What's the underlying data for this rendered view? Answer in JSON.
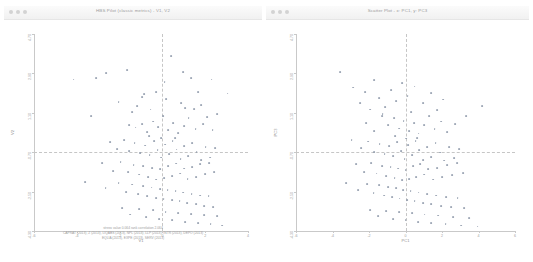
{
  "window_left": {
    "title": "HBS Pilot (classic metrics) - V1, V2",
    "controls": [
      "close-dot",
      "minimize-dot",
      "zoom-dot"
    ]
  },
  "window_right": {
    "title": "Scatter Plot - x: PC1, y: PC3",
    "controls": [
      "close-dot",
      "minimize-dot",
      "zoom-dot"
    ]
  },
  "footer": {
    "line1": "stress value  0.064   rank correlation  2.064",
    "line2": "CAPRAT (2013), Z (2013), LIQABS (2013), NPL (2013), LLP (2013), INTR (2013), DEPO (2013)",
    "line3": "EQLIA (2013), EXPE (2013), SERV (2013)"
  },
  "chart_data": [
    {
      "type": "scatter",
      "title": "HBS Pilot (classic metrics) - V1, V2",
      "xlabel": "V1",
      "ylabel": "V2",
      "xlim": [
        -6,
        4
      ],
      "ylim": [
        -4.3,
        4.7
      ],
      "xticks": [
        -6,
        -4,
        -2,
        0,
        2,
        4
      ],
      "xticklabels": [
        "-6",
        "-4",
        "-2",
        "0",
        "2",
        "4"
      ],
      "yticks": [
        -4.3,
        -2.5,
        -0.7,
        1.1,
        2.9,
        4.7
      ],
      "yticklabels": [
        "-4.30",
        "-2.50",
        "-0.70",
        "1.10",
        "2.90",
        "4.70"
      ],
      "grid": false,
      "legend": "none",
      "reference_lines": {
        "vertical_x": 0.0,
        "horizontal_y": -0.7
      },
      "annotation": "stress value  0.064   rank correlation  2.064",
      "marker_color": "#8c96a8",
      "points": [
        [
          -4.15,
          2.62
        ],
        [
          -3.1,
          2.7
        ],
        [
          -2.62,
          2.9
        ],
        [
          -1.65,
          3.05
        ],
        [
          -2.05,
          1.6
        ],
        [
          -3.35,
          0.95
        ],
        [
          -1.2,
          1.42
        ],
        [
          -0.85,
          1.95
        ],
        [
          -0.95,
          1.8
        ],
        [
          -0.55,
          1.25
        ],
        [
          -0.3,
          2.05
        ],
        [
          0.1,
          2.52
        ],
        [
          0.42,
          3.7
        ],
        [
          0.95,
          2.95
        ],
        [
          1.35,
          2.7
        ],
        [
          2.3,
          2.62
        ],
        [
          0.88,
          1.55
        ],
        [
          1.05,
          1.3
        ],
        [
          1.48,
          1.28
        ],
        [
          1.8,
          1.45
        ],
        [
          -1.55,
          0.55
        ],
        [
          -1.25,
          0.42
        ],
        [
          -0.95,
          0.58
        ],
        [
          -0.7,
          0.22
        ],
        [
          -0.45,
          0.7
        ],
        [
          -0.2,
          0.45
        ],
        [
          0.05,
          0.95
        ],
        [
          0.25,
          0.3
        ],
        [
          0.5,
          0.62
        ],
        [
          0.75,
          0.18
        ],
        [
          1.0,
          0.5
        ],
        [
          1.22,
          0.85
        ],
        [
          1.55,
          0.35
        ],
        [
          1.9,
          0.6
        ],
        [
          2.1,
          0.9
        ],
        [
          2.35,
          0.3
        ],
        [
          -2.45,
          -0.25
        ],
        [
          -2.1,
          -0.55
        ],
        [
          -1.8,
          -0.15
        ],
        [
          -1.55,
          -0.65
        ],
        [
          -1.3,
          -0.3
        ],
        [
          -1.05,
          -0.75
        ],
        [
          -0.8,
          -0.4
        ],
        [
          -0.6,
          -0.85
        ],
        [
          -0.4,
          -0.2
        ],
        [
          -0.22,
          -0.62
        ],
        [
          -0.05,
          -0.95
        ],
        [
          0.12,
          -0.35
        ],
        [
          0.3,
          -0.78
        ],
        [
          0.48,
          -0.18
        ],
        [
          0.66,
          -0.58
        ],
        [
          0.85,
          -1.02
        ],
        [
          1.02,
          -0.42
        ],
        [
          1.2,
          -0.88
        ],
        [
          1.4,
          -0.28
        ],
        [
          1.6,
          -0.68
        ],
        [
          1.82,
          -1.05
        ],
        [
          2.02,
          -0.45
        ],
        [
          2.22,
          -0.95
        ],
        [
          2.45,
          -0.52
        ],
        [
          -2.8,
          -1.2
        ],
        [
          -2.3,
          -1.55
        ],
        [
          -1.95,
          -1.15
        ],
        [
          -1.6,
          -1.62
        ],
        [
          -1.35,
          -1.28
        ],
        [
          -1.1,
          -1.72
        ],
        [
          -0.9,
          -1.35
        ],
        [
          -0.68,
          -1.85
        ],
        [
          -0.48,
          -1.42
        ],
        [
          -0.28,
          -1.95
        ],
        [
          -0.1,
          -1.48
        ],
        [
          0.08,
          -1.88
        ],
        [
          0.28,
          -1.32
        ],
        [
          0.46,
          -1.78
        ],
        [
          0.64,
          -1.22
        ],
        [
          0.82,
          -1.68
        ],
        [
          1.0,
          -1.45
        ],
        [
          1.18,
          -1.92
        ],
        [
          1.38,
          -1.38
        ],
        [
          1.58,
          -1.82
        ],
        [
          1.78,
          -1.25
        ],
        [
          1.98,
          -1.7
        ],
        [
          2.18,
          -1.18
        ],
        [
          2.42,
          -1.6
        ],
        [
          -3.6,
          -2.05
        ],
        [
          -2.65,
          -2.35
        ],
        [
          -2.05,
          -2.1
        ],
        [
          -1.7,
          -2.52
        ],
        [
          -1.42,
          -2.18
        ],
        [
          -1.15,
          -2.62
        ],
        [
          -0.92,
          -2.25
        ],
        [
          -0.7,
          -2.7
        ],
        [
          -0.5,
          -2.32
        ],
        [
          -0.3,
          -2.78
        ],
        [
          -0.12,
          -2.38
        ],
        [
          0.06,
          -2.85
        ],
        [
          0.24,
          -2.42
        ],
        [
          0.44,
          -2.88
        ],
        [
          0.62,
          -2.48
        ],
        [
          0.8,
          -2.95
        ],
        [
          0.98,
          -2.55
        ],
        [
          1.16,
          -3.02
        ],
        [
          1.36,
          -2.6
        ],
        [
          1.56,
          -3.08
        ],
        [
          1.76,
          -2.68
        ],
        [
          1.96,
          -3.15
        ],
        [
          2.16,
          -2.72
        ],
        [
          2.38,
          -3.2
        ],
        [
          -1.9,
          -3.25
        ],
        [
          -1.5,
          -3.55
        ],
        [
          -1.1,
          -3.3
        ],
        [
          -0.75,
          -3.68
        ],
        [
          -0.45,
          -3.35
        ],
        [
          -0.15,
          -3.75
        ],
        [
          0.15,
          -3.42
        ],
        [
          0.45,
          -3.82
        ],
        [
          0.75,
          -3.48
        ],
        [
          1.05,
          -3.88
        ],
        [
          1.35,
          -3.52
        ],
        [
          1.65,
          -3.95
        ],
        [
          1.95,
          -3.58
        ],
        [
          2.25,
          -4.0
        ],
        [
          2.55,
          -3.62
        ],
        [
          2.8,
          -4.05
        ],
        [
          -0.62,
          0.05
        ],
        [
          0.18,
          1.72
        ],
        [
          1.68,
          2.05
        ],
        [
          2.55,
          1.05
        ],
        [
          -1.42,
          1.12
        ],
        [
          -0.05,
          -0.05
        ],
        [
          0.58,
          -0.05
        ],
        [
          3.05,
          1.98
        ]
      ]
    },
    {
      "type": "scatter",
      "title": "Scatter Plot - x: PC1, y: PC3",
      "xlabel": "PC1",
      "ylabel": "PC3",
      "xlim": [
        -6,
        6
      ],
      "ylim": [
        -4.3,
        4.7
      ],
      "xticks": [
        -6,
        -4,
        -2,
        0,
        2,
        4,
        6
      ],
      "xticklabels": [
        "-6",
        "-4",
        "-2",
        "0",
        "2",
        "4",
        "6"
      ],
      "yticks": [
        -4.3,
        -2.5,
        -0.7,
        1.1,
        2.9,
        4.7
      ],
      "yticklabels": [
        "-4.30",
        "-2.50",
        "-0.70",
        "1.10",
        "2.90",
        "4.70"
      ],
      "grid": false,
      "legend": "none",
      "reference_lines": {
        "vertical_x": 0.0,
        "horizontal_y": -0.7
      },
      "marker_color": "#8c96a8",
      "points": [
        [
          -3.6,
          2.95
        ],
        [
          -2.85,
          2.25
        ],
        [
          -2.2,
          2.05
        ],
        [
          -1.7,
          2.6
        ],
        [
          -2.5,
          1.55
        ],
        [
          -1.95,
          1.25
        ],
        [
          -1.45,
          1.78
        ],
        [
          -1.1,
          1.35
        ],
        [
          -0.8,
          2.15
        ],
        [
          -0.5,
          1.62
        ],
        [
          -0.2,
          2.45
        ],
        [
          0.12,
          1.85
        ],
        [
          0.5,
          2.3
        ],
        [
          0.95,
          1.55
        ],
        [
          1.4,
          2.0
        ],
        [
          2.05,
          1.7
        ],
        [
          -1.3,
          0.95
        ],
        [
          -0.95,
          0.52
        ],
        [
          -0.62,
          0.85
        ],
        [
          -0.35,
          0.38
        ],
        [
          -0.1,
          0.72
        ],
        [
          0.18,
          0.25
        ],
        [
          0.45,
          0.62
        ],
        [
          0.72,
          0.15
        ],
        [
          1.0,
          0.55
        ],
        [
          1.28,
          0.95
        ],
        [
          1.6,
          0.35
        ],
        [
          1.95,
          0.7
        ],
        [
          2.3,
          0.22
        ],
        [
          2.7,
          0.58
        ],
        [
          -1.7,
          0.28
        ],
        [
          -2.15,
          0.62
        ],
        [
          -2.95,
          -0.15
        ],
        [
          -2.45,
          -0.52
        ],
        [
          -2.05,
          -0.22
        ],
        [
          -1.72,
          -0.68
        ],
        [
          -1.42,
          -0.32
        ],
        [
          -1.15,
          -0.78
        ],
        [
          -0.9,
          -0.42
        ],
        [
          -0.66,
          -0.88
        ],
        [
          -0.44,
          -0.25
        ],
        [
          -0.24,
          -0.65
        ],
        [
          -0.05,
          -1.0
        ],
        [
          0.15,
          -0.38
        ],
        [
          0.35,
          -0.82
        ],
        [
          0.55,
          -0.2
        ],
        [
          0.76,
          -0.62
        ],
        [
          0.98,
          -1.05
        ],
        [
          1.2,
          -0.45
        ],
        [
          1.42,
          -0.92
        ],
        [
          1.65,
          -0.3
        ],
        [
          1.88,
          -0.72
        ],
        [
          2.12,
          -1.08
        ],
        [
          2.38,
          -0.48
        ],
        [
          2.65,
          -0.98
        ],
        [
          2.95,
          -0.55
        ],
        [
          -2.7,
          -1.25
        ],
        [
          -2.25,
          -1.62
        ],
        [
          -1.88,
          -1.18
        ],
        [
          -1.58,
          -1.68
        ],
        [
          -1.3,
          -1.32
        ],
        [
          -1.05,
          -1.78
        ],
        [
          -0.82,
          -1.38
        ],
        [
          -0.6,
          -1.88
        ],
        [
          -0.4,
          -1.45
        ],
        [
          -0.2,
          -1.98
        ],
        [
          0.0,
          -1.52
        ],
        [
          0.2,
          -1.92
        ],
        [
          0.4,
          -1.35
        ],
        [
          0.6,
          -1.82
        ],
        [
          0.82,
          -1.25
        ],
        [
          1.04,
          -1.72
        ],
        [
          1.26,
          -1.48
        ],
        [
          1.5,
          -1.95
        ],
        [
          1.74,
          -1.42
        ],
        [
          2.0,
          -1.85
        ],
        [
          2.26,
          -1.28
        ],
        [
          2.54,
          -1.75
        ],
        [
          2.84,
          -1.2
        ],
        [
          3.15,
          -1.65
        ],
        [
          -3.25,
          -2.1
        ],
        [
          -2.6,
          -2.42
        ],
        [
          -2.1,
          -2.15
        ],
        [
          -1.75,
          -2.58
        ],
        [
          -1.45,
          -2.22
        ],
        [
          -1.18,
          -2.68
        ],
        [
          -0.95,
          -2.28
        ],
        [
          -0.72,
          -2.75
        ],
        [
          -0.52,
          -2.35
        ],
        [
          -0.32,
          -2.82
        ],
        [
          -0.12,
          -2.42
        ],
        [
          0.08,
          -2.88
        ],
        [
          0.28,
          -2.48
        ],
        [
          0.5,
          -2.95
        ],
        [
          0.72,
          -2.55
        ],
        [
          0.95,
          -3.02
        ],
        [
          1.18,
          -2.62
        ],
        [
          1.42,
          -3.08
        ],
        [
          1.68,
          -2.68
        ],
        [
          1.95,
          -3.15
        ],
        [
          2.22,
          -2.75
        ],
        [
          2.52,
          -3.2
        ],
        [
          2.85,
          -2.8
        ],
        [
          3.2,
          -3.25
        ],
        [
          -1.95,
          -3.35
        ],
        [
          -1.5,
          -3.62
        ],
        [
          -1.05,
          -3.38
        ],
        [
          -0.68,
          -3.75
        ],
        [
          -0.35,
          -3.42
        ],
        [
          0.0,
          -3.82
        ],
        [
          0.35,
          -3.48
        ],
        [
          0.7,
          -3.88
        ],
        [
          1.05,
          -3.55
        ],
        [
          1.42,
          -3.95
        ],
        [
          1.8,
          -3.6
        ],
        [
          2.2,
          -4.0
        ],
        [
          2.62,
          -3.65
        ],
        [
          3.05,
          -4.05
        ],
        [
          3.5,
          -3.7
        ],
        [
          3.95,
          -4.1
        ],
        [
          -0.55,
          0.05
        ],
        [
          0.3,
          1.15
        ],
        [
          1.75,
          1.22
        ],
        [
          3.3,
          0.95
        ],
        [
          -1.25,
          1.05
        ],
        [
          0.05,
          -0.08
        ],
        [
          0.65,
          -0.05
        ],
        [
          4.2,
          1.4
        ]
      ]
    }
  ]
}
